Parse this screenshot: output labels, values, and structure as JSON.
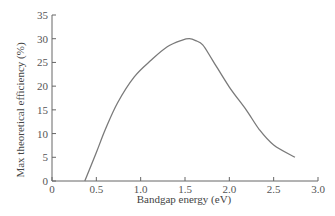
{
  "chart_data": {
    "type": "line",
    "title": "",
    "xlabel": "Bandgap energy (eV)",
    "ylabel": "Max theoretical efficiency (%)",
    "xlim": [
      0,
      3.0
    ],
    "ylim": [
      0,
      35
    ],
    "grid": false,
    "legend": null,
    "x_ticks": [
      "0",
      "0.5",
      "1.0",
      "1.5",
      "2.0",
      "2.5",
      "3.0"
    ],
    "y_ticks": [
      "0",
      "5",
      "10",
      "15",
      "20",
      "25",
      "30",
      "35"
    ],
    "series": [
      {
        "name": "Max theoretical efficiency",
        "color": "#7a7a7a",
        "x": [
          0.37,
          0.5,
          0.6,
          0.74,
          0.93,
          1.12,
          1.3,
          1.47,
          1.55,
          1.62,
          1.7,
          1.81,
          2.0,
          2.19,
          2.34,
          2.5,
          2.74
        ],
        "y": [
          0.0,
          6.0,
          10.8,
          16.5,
          22.0,
          25.5,
          28.3,
          29.7,
          30.0,
          29.6,
          28.7,
          25.5,
          19.8,
          15.0,
          10.8,
          7.6,
          5.0
        ]
      }
    ]
  }
}
